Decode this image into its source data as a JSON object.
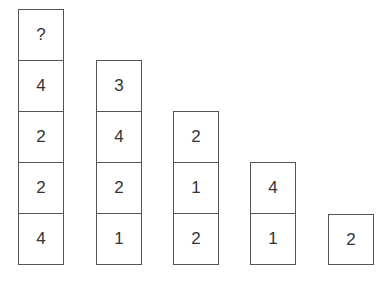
{
  "puzzle": {
    "columns": [
      {
        "cells": [
          "?",
          "4",
          "2",
          "2",
          "4"
        ]
      },
      {
        "cells": [
          "3",
          "4",
          "2",
          "1"
        ]
      },
      {
        "cells": [
          "2",
          "1",
          "2"
        ]
      },
      {
        "cells": [
          "4",
          "1"
        ]
      },
      {
        "cells": [
          "2"
        ]
      }
    ]
  }
}
